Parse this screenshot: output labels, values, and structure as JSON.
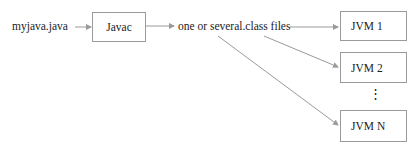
{
  "diagram": {
    "source_file": "myjava.java",
    "compiler": "Javac",
    "output": "one or several.class files",
    "jvms": [
      "JVM 1",
      "JVM 2",
      "JVM N"
    ],
    "ellipsis": "⋮",
    "line_color": "#9a9a9a"
  }
}
